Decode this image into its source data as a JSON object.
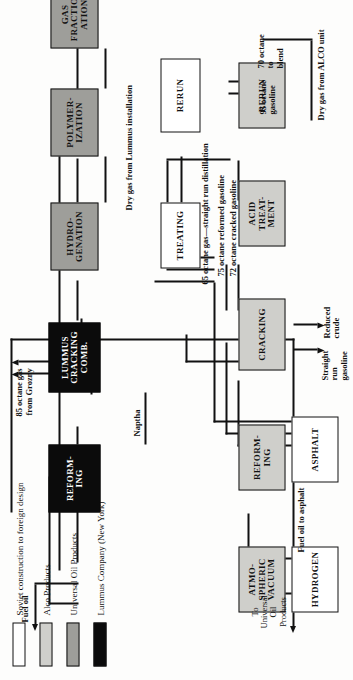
{
  "diagram": {
    "orientation_deg": -90
  },
  "legend": {
    "items": [
      {
        "label": "Soviet construction to foreign design",
        "color": "#ffffff",
        "swatch": "sw-white"
      },
      {
        "label": "Alco Products",
        "color": "#cfcfcb",
        "swatch": "sw-light"
      },
      {
        "label": "Universal Oil Products",
        "color": "#9e9e9a",
        "swatch": "sw-mid"
      },
      {
        "label": "Lummus Company (New York)",
        "color": "#0b0b0b",
        "swatch": "sw-black"
      }
    ]
  },
  "nodes": [
    {
      "id": "hydrogen",
      "label": "HYDROGEN",
      "swatch": "sw-white"
    },
    {
      "id": "asphalt",
      "label": "ASPHALT",
      "swatch": "sw-white"
    },
    {
      "id": "atmo",
      "label": "ATMO-\nSPHERIC\nVACUUM",
      "swatch": "sw-light"
    },
    {
      "id": "reform1",
      "label": "REFORM-\nING",
      "swatch": "sw-light"
    },
    {
      "id": "cracking",
      "label": "CRACKING",
      "swatch": "sw-light"
    },
    {
      "id": "acid",
      "label": "ACID\nTREAT-\nMENT",
      "swatch": "sw-light"
    },
    {
      "id": "rerun1",
      "label": "RERUN",
      "swatch": "sw-light"
    },
    {
      "id": "treating",
      "label": "TREATING",
      "swatch": "sw-white"
    },
    {
      "id": "rerun2",
      "label": "RERUN",
      "swatch": "sw-white"
    },
    {
      "id": "reform2",
      "label": "REFORM-\nING",
      "swatch": "sw-black"
    },
    {
      "id": "lummus",
      "label": "LUMMUS\nCRACKING\nCOMB.",
      "swatch": "sw-black"
    },
    {
      "id": "hydro",
      "label": "HYDRO-\nGENATION",
      "swatch": "sw-mid"
    },
    {
      "id": "polymer",
      "label": "POLYMER-\nIZATION",
      "swatch": "sw-mid"
    },
    {
      "id": "gasfrac",
      "label": "GAS\nFRACTION-\nATION",
      "swatch": "sw-mid"
    }
  ],
  "stream_labels": {
    "to_uop": "To\nUniversal\nOil\nProducts",
    "fuel_oil_to_asphalt": "Fuel oil to asphalt",
    "naptha": "Naptha",
    "straight_run_gasoline": "Straight\nrun\ngasoline",
    "reduced_crude": "Reduced\ncrude",
    "gas_65": "65 octane gas—straight run distillation",
    "gas_75": "75 octane reformed gasoline",
    "gas_72": "72 octane cracked gasoline",
    "fuel_oil": "Fuel oil",
    "grozny": "85 octane gas\nfrom Grozny",
    "dry_gas_lummus": "Dry gas from Lummus installation",
    "dry_gas_alco": "Dry gas from ALCO unit",
    "octane_70": "70 octane\nto\nblend",
    "octane_95": "95 octane\ngasoline"
  }
}
